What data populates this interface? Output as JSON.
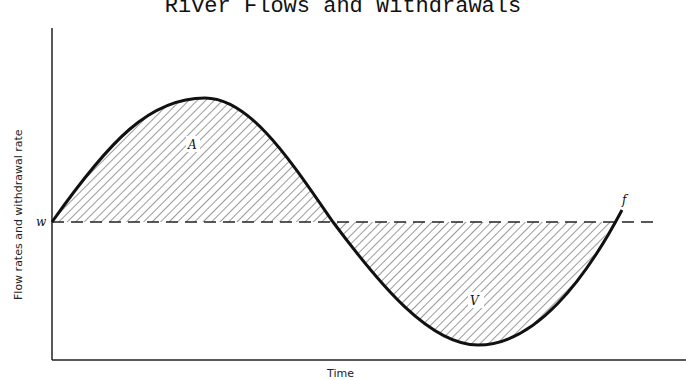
{
  "title": "River Flows and Withdrawals",
  "axes": {
    "y_label": "Flow rates and withdrawal rate",
    "x_label": "Time"
  },
  "labels": {
    "withdrawal": "w",
    "flow_curve": "f",
    "surplus_area": "A",
    "deficit_area": "V"
  },
  "colors": {
    "ink": "#111111",
    "hatch": "#555555",
    "background": "#ffffff"
  }
}
